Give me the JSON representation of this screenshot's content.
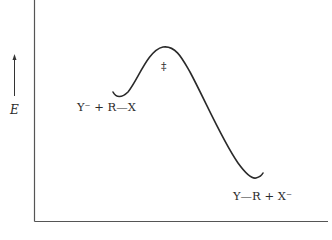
{
  "diagram": {
    "type": "reaction-energy-profile",
    "y_axis_label": "E",
    "y_axis_arrow": "up",
    "reactants_label": "Y⁻ + R—X",
    "transition_state_label": "‡",
    "products_label": "Y—R + X⁻",
    "colors": {
      "line": "#2a2a2a",
      "axis": "#555555",
      "background": "#ffffff"
    }
  }
}
